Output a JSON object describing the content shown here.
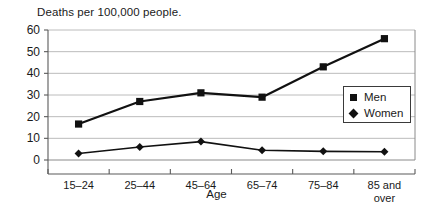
{
  "chart_data": {
    "type": "line",
    "title": "Deaths per 100,000 people.",
    "xlabel": "Age",
    "ylabel": "",
    "categories": [
      "15–24",
      "25–44",
      "45–64",
      "65–74",
      "75–84",
      "85 and over"
    ],
    "category_lines": [
      [
        "15–24"
      ],
      [
        "25–44"
      ],
      [
        "45–64"
      ],
      [
        "65–74"
      ],
      [
        "75–84"
      ],
      [
        "85 and",
        "over"
      ]
    ],
    "series": [
      {
        "name": "Men",
        "marker": "square",
        "color": "#111111",
        "values": [
          16.6,
          27,
          31,
          29,
          43,
          56
        ]
      },
      {
        "name": "Women",
        "marker": "diamond",
        "color": "#111111",
        "values": [
          3,
          6,
          8.5,
          4.5,
          4,
          3.8
        ]
      }
    ],
    "ylim": [
      0,
      60
    ],
    "yticks": [
      0,
      10,
      20,
      30,
      40,
      50,
      60
    ],
    "ytick_labels": [
      "0",
      "10",
      "20",
      "30",
      "40",
      "50",
      "60"
    ],
    "grid": true,
    "grid_axis": "y",
    "legend_position": "right-middle"
  },
  "legend": {
    "entries": [
      {
        "label": "Men",
        "marker": "square-marker"
      },
      {
        "label": "Women",
        "marker": "diamond-marker"
      }
    ]
  }
}
